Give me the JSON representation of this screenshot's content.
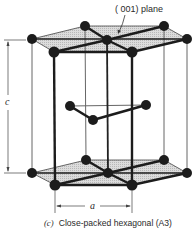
{
  "figure": {
    "plane_label": "( 001) plane",
    "c_label": "c",
    "a_label": "a",
    "caption_prefix": "(c)",
    "caption_text": "Close-packed hexagonal (A3)"
  },
  "colors": {
    "atom": "#1c1c1c",
    "edge": "#222222",
    "plane_fill": "#cfcfcf",
    "thin_line": "#555555"
  },
  "atoms": {
    "top": [
      [
        32,
        39
      ],
      [
        85,
        26
      ],
      [
        107,
        40
      ],
      [
        164,
        26
      ],
      [
        187,
        39
      ],
      [
        54,
        52
      ],
      [
        132,
        52
      ]
    ],
    "middle": [
      [
        70,
        106
      ],
      [
        146,
        105
      ],
      [
        93,
        120
      ]
    ],
    "bottom": [
      [
        32,
        173
      ],
      [
        86,
        160
      ],
      [
        108,
        173
      ],
      [
        164,
        160
      ],
      [
        187,
        173
      ],
      [
        55,
        185
      ],
      [
        132,
        185
      ]
    ]
  }
}
